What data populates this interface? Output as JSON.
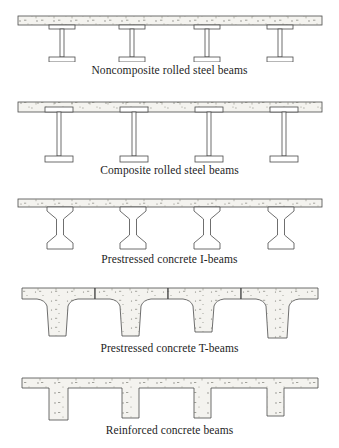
{
  "figure": {
    "title_implicit": "Typical bridge superstructure cross sections",
    "panel_count": 5,
    "girders_per_panel": 4,
    "colors": {
      "outline": "#4a4a4a",
      "deck_fill": "#f4f3ef",
      "beam_fill": "#ffffff",
      "concrete_fill": "#f4f3ef",
      "stipple": "#7a7a72",
      "caption_text": "#1d1d1d",
      "background": "#ffffff"
    }
  },
  "panels": [
    {
      "id": "noncomposite-rolled-steel",
      "caption": "Noncomposite rolled steel beams",
      "deck": {
        "left": 18,
        "right": 322,
        "thickness": 9
      },
      "beam_type": "steel-i-beam",
      "beam_embedded_in_deck": false,
      "girder_x": [
        62,
        132,
        207,
        280
      ],
      "beam": {
        "flange_width": 26,
        "flange_thickness": 4,
        "web_width": 4,
        "depth": 40
      }
    },
    {
      "id": "composite-rolled-steel",
      "caption": "Composite rolled steel beams",
      "deck": {
        "left": 18,
        "right": 322,
        "thickness": 10
      },
      "beam_type": "steel-i-beam",
      "beam_embedded_in_deck": true,
      "girder_x": [
        58,
        133,
        208,
        283
      ],
      "beam": {
        "flange_width": 28,
        "flange_thickness": 5,
        "web_width": 4,
        "depth": 50
      }
    },
    {
      "id": "prestressed-concrete-i",
      "caption": "Prestressed concrete I-beams",
      "deck": {
        "left": 18,
        "right": 322,
        "thickness": 8
      },
      "beam_type": "prestressed-i-girder",
      "beam_embedded_in_deck": false,
      "girder_x": [
        60,
        133,
        207,
        281
      ],
      "beam": {
        "top_flange_width": 26,
        "bottom_flange_width": 24,
        "web_width": 7,
        "depth": 42
      }
    },
    {
      "id": "prestressed-concrete-t",
      "caption": "Prestressed concrete T-beams",
      "deck": {
        "left": 18,
        "right": 322,
        "thickness": 11
      },
      "beam_type": "precast-t-girder",
      "beam_embedded_in_deck": true,
      "girder_x": [
        59,
        131,
        204,
        277
      ],
      "beam": {
        "stem_top_width": 22,
        "stem_bottom_width": 16,
        "depth": 46,
        "haunch": true
      },
      "deck_joints_x": [
        95,
        168,
        241
      ]
    },
    {
      "id": "reinforced-concrete",
      "caption": "Reinforced concrete beams",
      "deck": {
        "left": 22,
        "right": 318,
        "thickness": 10
      },
      "beam_type": "rc-t-beam",
      "beam_embedded_in_deck": true,
      "girder_x": [
        60,
        133,
        206,
        280
      ],
      "beam": {
        "stem_width": 17,
        "depth": 32
      }
    }
  ]
}
